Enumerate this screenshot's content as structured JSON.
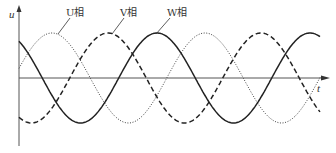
{
  "chart_data": {
    "type": "line",
    "title": "",
    "xlabel": "t",
    "ylabel": "u",
    "grid": false,
    "legend_position": "inline-annotations",
    "x_range_px": [
      19,
      320
    ],
    "period_px": 153,
    "amplitude_px": 45,
    "axis_y_px": 78,
    "series": [
      {
        "name": "U相",
        "style": "dotted",
        "phase_deg": 0,
        "peak_x_px": [
          52,
          205
        ],
        "trough_x_px": [
          130,
          283
        ]
      },
      {
        "name": "V相",
        "style": "dashed",
        "phase_deg": -120,
        "peak_x_px": [
          108,
          260
        ],
        "trough_x_px": [
          30,
          183
        ]
      },
      {
        "name": "W相",
        "style": "solid",
        "phase_deg": 120,
        "peak_x_px": [
          157,
          313
        ],
        "trough_x_px": [
          82,
          235
        ]
      }
    ]
  },
  "labels": {
    "u_axis": "u",
    "t_axis": "t",
    "U": "U相",
    "V": "V相",
    "W": "W相"
  },
  "colors": {
    "line": "#222222",
    "axis": "#555555"
  }
}
